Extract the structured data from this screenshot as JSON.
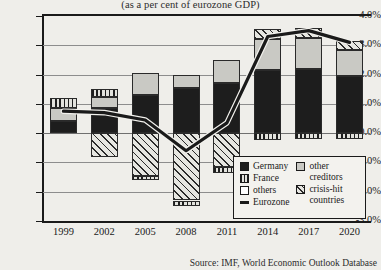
{
  "chart_data": {
    "type": "bar",
    "title": "",
    "subtitle": "(as a per cent of eurozone GDP)",
    "xlabel": "",
    "ylabel": "",
    "ylim": [
      -3.0,
      4.0
    ],
    "ytick_values": [
      4.0,
      3.0,
      2.0,
      1.0,
      0.0,
      -1.0,
      -2.0,
      -3.0
    ],
    "ytick_labels": [
      "4.0%",
      "3.0%",
      "2.0%",
      "1.0%",
      "0.0%",
      "-1.0%",
      "-2.0%",
      "-3.0%"
    ],
    "grid": true,
    "legend_position": "inside-bottom-right",
    "categories": [
      "1999",
      "2002",
      "2005",
      "2008",
      "2011",
      "2014",
      "2017",
      "2020"
    ],
    "stacked": true,
    "series": [
      {
        "name": "Germany",
        "key": "germany",
        "values": [
          0.4,
          0.85,
          1.3,
          1.55,
          1.7,
          2.15,
          2.2,
          1.95
        ]
      },
      {
        "name": "France",
        "key": "france",
        "values": [
          0.35,
          0.25,
          -0.15,
          -0.2,
          -0.2,
          -0.25,
          -0.2,
          -0.2
        ]
      },
      {
        "name": "others",
        "key": "others",
        "values": [
          0.0,
          0.0,
          0.0,
          0.0,
          0.0,
          0.0,
          0.0,
          0.0
        ]
      },
      {
        "name": "other creditors",
        "key": "creditors",
        "values": [
          0.45,
          0.4,
          0.75,
          0.45,
          0.8,
          1.05,
          1.05,
          0.9
        ]
      },
      {
        "name": "crisis-hit countries",
        "key": "crisis",
        "values": [
          0.0,
          -0.8,
          -1.45,
          -2.3,
          -1.15,
          0.35,
          0.35,
          0.3
        ]
      }
    ],
    "line_series": {
      "name": "Eurozone",
      "values": [
        0.75,
        0.7,
        0.45,
        -0.6,
        0.35,
        3.3,
        3.5,
        3.1
      ]
    },
    "legend": [
      {
        "label": "Germany",
        "swatch": "germany"
      },
      {
        "label": "France",
        "swatch": "france"
      },
      {
        "label": "others",
        "swatch": "others"
      },
      {
        "label": "Eurozone",
        "swatch": "line"
      },
      {
        "label": "other creditors",
        "swatch": "creditors"
      },
      {
        "label": "crisis-hit countries",
        "swatch": "crisis"
      }
    ],
    "source": "Source: IMF, World Economic Outlook Database",
    "colors": {
      "germany": "#1d1d1d",
      "others": "#ffffff",
      "creditors": "#c9c9c4",
      "france": "#e2e2dd",
      "crisis": "#e6e6e1",
      "line": "#1a1a1a",
      "background": "#efeeea",
      "grid": "#8d8d8d"
    }
  }
}
